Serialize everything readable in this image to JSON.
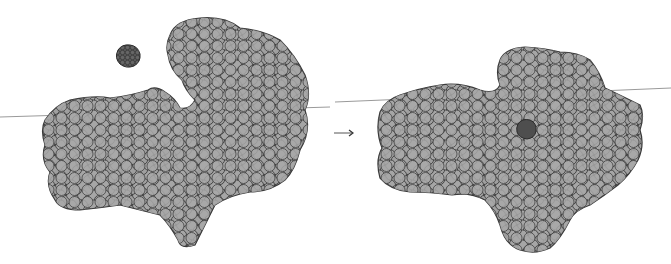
{
  "figure": {
    "left_panel": {
      "state": "open conformation with separate ligand",
      "protein_color": "#a3a3a3",
      "ligand_color": "#555555"
    },
    "right_panel": {
      "state": "closed conformation with bound ligand",
      "protein_color": "#a3a3a3",
      "ligand_color": "#444444"
    },
    "arrow": {
      "symbol": "→",
      "color": "#555555"
    },
    "baseline_color": "#9a9a9a"
  }
}
